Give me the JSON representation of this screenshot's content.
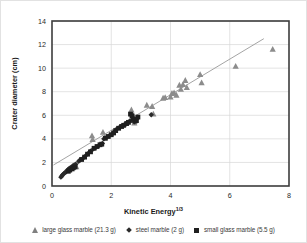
{
  "chart_data": {
    "type": "scatter",
    "title": "",
    "xlabel": "Kinetic Energy",
    "xlabel_sup": "1/3",
    "ylabel": "Crater diameter (cm)",
    "xlim": [
      0,
      8
    ],
    "ylim": [
      0,
      14
    ],
    "xticks": [
      0,
      2,
      4,
      6,
      8
    ],
    "yticks": [
      0,
      2,
      4,
      6,
      8,
      10,
      12,
      14
    ],
    "grid": "horizontal-and-vertical",
    "legend_position": "bottom",
    "trendline": {
      "name": "linear fit",
      "x0": 0.05,
      "y0": 1.78,
      "x1": 7.15,
      "y1": 12.5,
      "color": "#9a9a9a"
    },
    "series": [
      {
        "name": "large glass marble (21.3 g)",
        "marker": "triangle",
        "color": "#8c8c8c",
        "points": [
          [
            1.35,
            4.25
          ],
          [
            1.37,
            3.95
          ],
          [
            1.72,
            4.55
          ],
          [
            1.78,
            4.1
          ],
          [
            0.82,
            1.62
          ],
          [
            2.68,
            6.45
          ],
          [
            2.72,
            6.1
          ],
          [
            2.78,
            5.35
          ],
          [
            3.2,
            6.85
          ],
          [
            3.38,
            6.75
          ],
          [
            3.42,
            6.1
          ],
          [
            3.75,
            7.45
          ],
          [
            3.82,
            7.5
          ],
          [
            4.0,
            7.55
          ],
          [
            4.05,
            7.85
          ],
          [
            4.12,
            7.9
          ],
          [
            4.2,
            7.7
          ],
          [
            4.3,
            8.55
          ],
          [
            4.35,
            8.2
          ],
          [
            4.42,
            8.6
          ],
          [
            4.5,
            8.95
          ],
          [
            4.55,
            8.35
          ],
          [
            5.0,
            9.45
          ],
          [
            5.05,
            8.75
          ],
          [
            6.2,
            10.15
          ],
          [
            7.45,
            11.6
          ]
        ]
      },
      {
        "name": "steel marble (2 g)",
        "marker": "diamond",
        "color": "#2b2b2b",
        "points": [
          [
            0.3,
            0.75
          ],
          [
            0.33,
            0.85
          ],
          [
            0.36,
            0.95
          ],
          [
            0.4,
            1.05
          ],
          [
            0.44,
            1.15
          ],
          [
            0.48,
            1.2
          ],
          [
            0.52,
            1.35
          ],
          [
            0.56,
            1.45
          ],
          [
            0.6,
            1.5
          ],
          [
            0.65,
            1.6
          ],
          [
            0.7,
            1.7
          ],
          [
            0.75,
            1.78
          ],
          [
            0.8,
            1.85
          ],
          [
            0.9,
            2.1
          ],
          [
            0.95,
            2.2
          ],
          [
            1.05,
            2.35
          ],
          [
            1.15,
            2.6
          ],
          [
            1.25,
            2.85
          ],
          [
            1.3,
            2.95
          ],
          [
            1.4,
            3.15
          ],
          [
            1.5,
            3.3
          ],
          [
            1.6,
            3.45
          ],
          [
            1.7,
            3.6
          ],
          [
            1.75,
            4.0
          ],
          [
            1.85,
            4.15
          ],
          [
            1.95,
            4.3
          ],
          [
            2.05,
            4.45
          ],
          [
            2.1,
            4.6
          ],
          [
            2.2,
            4.85
          ],
          [
            2.3,
            5.0
          ],
          [
            2.38,
            5.1
          ],
          [
            2.45,
            5.2
          ],
          [
            2.5,
            5.25
          ],
          [
            2.55,
            5.35
          ],
          [
            2.62,
            5.5
          ],
          [
            2.68,
            5.55
          ],
          [
            2.72,
            5.6
          ],
          [
            2.78,
            5.45
          ],
          [
            2.82,
            5.65
          ],
          [
            2.88,
            5.75
          ],
          [
            3.35,
            6.05
          ]
        ]
      },
      {
        "name": "small glass marble (5.5 g)",
        "marker": "square",
        "color": "#1f1f1f",
        "points": [
          [
            0.55,
            1.25
          ],
          [
            0.6,
            1.35
          ],
          [
            0.68,
            1.45
          ],
          [
            0.72,
            1.55
          ],
          [
            0.78,
            1.62
          ],
          [
            1.0,
            2.25
          ],
          [
            1.1,
            2.45
          ],
          [
            1.2,
            2.7
          ],
          [
            1.3,
            2.9
          ],
          [
            1.42,
            3.2
          ],
          [
            1.52,
            3.35
          ],
          [
            1.62,
            3.5
          ],
          [
            1.68,
            3.55
          ],
          [
            1.8,
            4.05
          ],
          [
            1.9,
            4.2
          ],
          [
            2.0,
            4.35
          ],
          [
            2.08,
            4.5
          ],
          [
            2.15,
            4.7
          ],
          [
            2.25,
            4.9
          ],
          [
            2.35,
            5.05
          ],
          [
            2.42,
            5.15
          ],
          [
            2.52,
            5.3
          ],
          [
            2.58,
            5.4
          ],
          [
            2.65,
            6.1
          ],
          [
            2.7,
            5.95
          ],
          [
            2.74,
            5.7
          ],
          [
            2.8,
            5.5
          ],
          [
            2.85,
            5.55
          ],
          [
            2.9,
            5.85
          ]
        ]
      }
    ]
  },
  "legend": {
    "items": [
      {
        "label": "large glass marble (21.3 g)",
        "marker": "triangle"
      },
      {
        "label": "steel marble (2 g)",
        "marker": "diamond"
      },
      {
        "label": "small glass marble (5.5 g)",
        "marker": "square"
      }
    ]
  }
}
